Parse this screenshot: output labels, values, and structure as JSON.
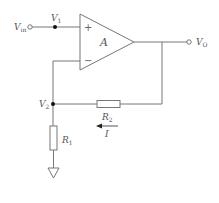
{
  "diagram": {
    "colors": {
      "wire": "#777777",
      "text": "#555555",
      "node": "#111111"
    },
    "labels": {
      "vin": {
        "main": "V",
        "sub": "in"
      },
      "v1": {
        "main": "V",
        "sub": "1"
      },
      "v2": {
        "main": "V",
        "sub": "2"
      },
      "vo": {
        "main": "V",
        "sub": "O"
      },
      "opamp_gain": "A",
      "plus": "+",
      "minus": "−",
      "r1": {
        "main": "R",
        "sub": "1"
      },
      "r2": {
        "main": "R",
        "sub": "2"
      },
      "current": "I"
    },
    "components": [
      {
        "id": "opamp",
        "type": "op-amp",
        "label": "A"
      },
      {
        "id": "R1",
        "type": "resistor",
        "from": "V2",
        "to": "ground"
      },
      {
        "id": "R2",
        "type": "resistor",
        "from": "Vo",
        "to": "V2"
      },
      {
        "id": "ground",
        "type": "ground"
      }
    ],
    "nodes": [
      "Vin",
      "V1",
      "V2",
      "Vo"
    ],
    "current_arrow": {
      "label": "I",
      "direction": "left"
    }
  }
}
